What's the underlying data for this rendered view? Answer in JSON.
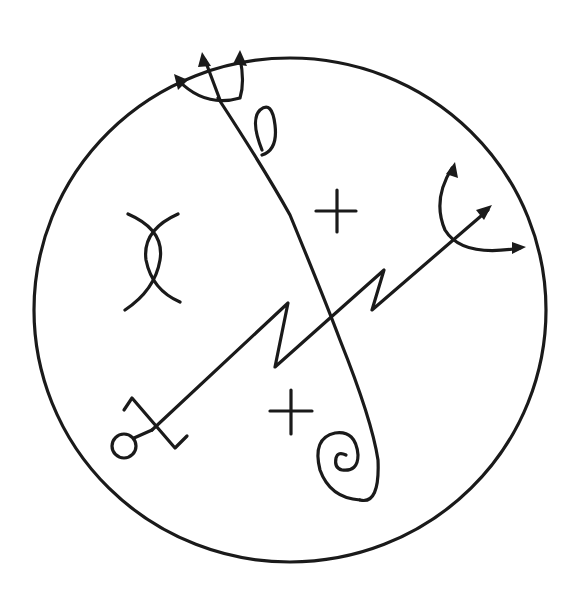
{
  "figure": {
    "type": "hand-drawn sigil",
    "stroke_color": "#1a1a1a",
    "background_color": "#ffffff",
    "elements": [
      {
        "name": "outer-circle",
        "shape": "circle"
      },
      {
        "name": "trident-top",
        "shape": "three-pronged arrow fork"
      },
      {
        "name": "loop-oval",
        "shape": "small oval loop"
      },
      {
        "name": "long-curve",
        "shape": "curved line from top fork to spiral"
      },
      {
        "name": "spiral",
        "shape": "spiral at bottom"
      },
      {
        "name": "cross-upper",
        "shape": "plus sign"
      },
      {
        "name": "cross-lower",
        "shape": "plus sign"
      },
      {
        "name": "crossed-arcs",
        "shape": "two crossing arcs"
      },
      {
        "name": "zigzag-arrow",
        "shape": "diagonal zig-zag line ending in arrow"
      },
      {
        "name": "right-fork",
        "shape": "curved two-pronged arrow"
      },
      {
        "name": "bottom-left-terminal",
        "shape": "small circle with crossed hook"
      }
    ]
  }
}
